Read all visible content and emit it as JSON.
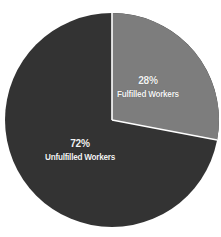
{
  "chart_data": {
    "type": "pie",
    "title": "",
    "subtitle": "",
    "xlabel": "",
    "ylabel": "",
    "legend_position": "none",
    "grid": false,
    "labels_inside_slices": true,
    "categories": [
      "Fulfilled Workers",
      "Unfulfilled Workers"
    ],
    "values": [
      28,
      72
    ],
    "unit": "%",
    "slices": [
      {
        "name": "Fulfilled Workers",
        "value": 28,
        "pct_text": "28%",
        "color": "#7d7d7d",
        "start_angle_deg": 0,
        "end_angle_deg": 100.8
      },
      {
        "name": "Unfulfilled Workers",
        "value": 72,
        "pct_text": "72%",
        "color": "#333333",
        "start_angle_deg": 100.8,
        "end_angle_deg": 360
      }
    ]
  },
  "colors": {
    "background": "#ffffff",
    "dark_slice": "#333333",
    "light_slice": "#7d7d7d",
    "divider": "#ffffff",
    "label_text": "#f2f2f2"
  },
  "geometry": {
    "center_x": 112,
    "center_y": 120,
    "radius": 107
  }
}
